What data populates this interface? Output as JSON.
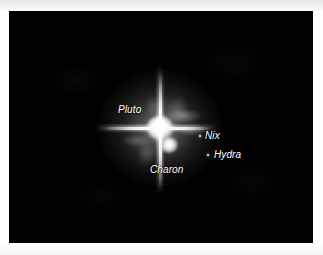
{
  "page": {
    "background_color": "#ffffff"
  },
  "photo": {
    "background_color": "#000000",
    "alt": "Telescope image of the Pluto system showing diffraction spikes",
    "labels": [
      {
        "id": "pluto",
        "text": "Pluto"
      },
      {
        "id": "charon",
        "text": "Charon"
      },
      {
        "id": "nix",
        "text": "Nix"
      },
      {
        "id": "hydra",
        "text": "Hydra"
      }
    ],
    "objects": [
      {
        "id": "pluto",
        "name": "Pluto",
        "type": "planet-core",
        "brightness": "very-bright",
        "color": "#ffffff"
      },
      {
        "id": "charon",
        "name": "Charon",
        "type": "moon-core",
        "brightness": "bright",
        "color": "#ffffff"
      },
      {
        "id": "nix",
        "name": "Nix",
        "type": "moon-point",
        "brightness": "faint",
        "color": "#e9e9e9"
      },
      {
        "id": "hydra",
        "name": "Hydra",
        "type": "moon-point",
        "brightness": "faint",
        "color": "#e9e9e9"
      }
    ],
    "features": {
      "diffraction_spikes": "vertical-and-horizontal",
      "halo": "radial-glow"
    }
  }
}
